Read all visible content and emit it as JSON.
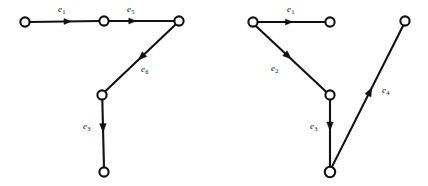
{
  "figure": {
    "background_color": "#ffffff",
    "stroke_color": "#111111",
    "node_fill_color": "#ffffff",
    "width": 428,
    "height": 186
  },
  "graphs": [
    {
      "id": "left-graph",
      "name": "left-directed-graph",
      "nodes": [
        {
          "id": "L1",
          "name": "node-top-left",
          "x": 25,
          "y": 22,
          "r": 4.6
        },
        {
          "id": "L2",
          "name": "node-top-middle",
          "x": 104,
          "y": 21,
          "r": 4.6
        },
        {
          "id": "L3",
          "name": "node-top-right",
          "x": 179,
          "y": 21,
          "r": 4.6
        },
        {
          "id": "L4",
          "name": "node-junction",
          "x": 102,
          "y": 95,
          "r": 4.6
        },
        {
          "id": "L5",
          "name": "node-bottom",
          "x": 104,
          "y": 172,
          "r": 4.6
        }
      ],
      "edges": [
        {
          "id": "L-e1",
          "name": "edge-e1",
          "label": "e",
          "subscript": "1",
          "from": "L1",
          "to": "L2",
          "x1": 29.6,
          "y1": 22,
          "x2": 99.4,
          "y2": 21,
          "arrow_t": 0.6,
          "arrow_size": 7.5,
          "label_x": 58,
          "label_y": 5
        },
        {
          "id": "L-e5",
          "name": "edge-e5",
          "label": "e",
          "subscript": "5",
          "from": "L2",
          "to": "L3",
          "x1": 108.6,
          "y1": 21,
          "x2": 174.4,
          "y2": 21,
          "arrow_t": 0.42,
          "arrow_size": 7.5,
          "label_x": 127,
          "label_y": 5
        },
        {
          "id": "L-e6",
          "name": "edge-e6",
          "label": "e",
          "subscript": "6",
          "from": "L3",
          "to": "L4",
          "x1": 175.6,
          "y1": 24.6,
          "x2": 105.3,
          "y2": 91.3,
          "arrow_t": 0.53,
          "arrow_size": 8.5,
          "label_x": 141,
          "label_y": 65
        },
        {
          "id": "L-e3",
          "name": "edge-e3",
          "label": "e",
          "subscript": "3",
          "from": "L4",
          "to": "L5",
          "x1": 102.3,
          "y1": 99.6,
          "x2": 104,
          "y2": 167.4,
          "arrow_t": 0.48,
          "arrow_size": 8.5,
          "label_x": 83,
          "label_y": 122
        }
      ]
    },
    {
      "id": "right-graph",
      "name": "right-directed-graph",
      "nodes": [
        {
          "id": "R1",
          "name": "node-top-left",
          "x": 253,
          "y": 22,
          "r": 4.6
        },
        {
          "id": "R2",
          "name": "node-top-middle",
          "x": 330,
          "y": 22,
          "r": 4.6
        },
        {
          "id": "R3",
          "name": "node-junction",
          "x": 330,
          "y": 95,
          "r": 4.6
        },
        {
          "id": "R4",
          "name": "node-bottom",
          "x": 330,
          "y": 172,
          "r": 5.2
        },
        {
          "id": "R5",
          "name": "node-top-right",
          "x": 405,
          "y": 21,
          "r": 4.6
        }
      ],
      "edges": [
        {
          "id": "R-e1",
          "name": "edge-e1",
          "label": "e",
          "subscript": "1",
          "from": "R1",
          "to": "R2",
          "x1": 257.6,
          "y1": 22,
          "x2": 325.4,
          "y2": 22,
          "arrow_t": 0.52,
          "arrow_size": 7.5,
          "label_x": 287,
          "label_y": 5
        },
        {
          "id": "R-e2",
          "name": "edge-e2",
          "label": "e",
          "subscript": "2",
          "from": "R1",
          "to": "R3",
          "x1": 255.9,
          "y1": 26.1,
          "x2": 326.4,
          "y2": 91.9,
          "arrow_t": 0.5,
          "arrow_size": 8.5,
          "label_x": 271,
          "label_y": 64
        },
        {
          "id": "R-e3",
          "name": "edge-e3",
          "label": "e",
          "subscript": "3",
          "from": "R3",
          "to": "R4",
          "x1": 330,
          "y1": 99.6,
          "x2": 330,
          "y2": 166.8,
          "arrow_t": 0.46,
          "arrow_size": 8.5,
          "label_x": 310,
          "label_y": 122
        },
        {
          "id": "R-e4",
          "name": "edge-e4",
          "label": "e",
          "subscript": "4",
          "from": "R4",
          "to": "R5",
          "x1": 331.8,
          "y1": 167.1,
          "x2": 403.2,
          "y2": 25.5,
          "arrow_t": 0.56,
          "arrow_size": 8.5,
          "label_x": 382,
          "label_y": 86
        }
      ]
    }
  ]
}
